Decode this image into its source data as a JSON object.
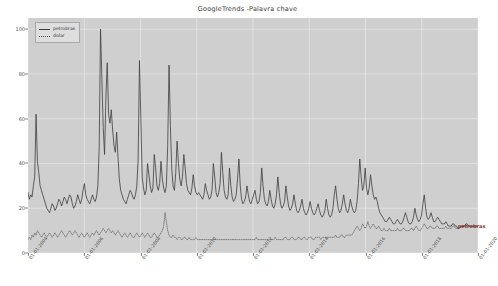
{
  "chart_data": {
    "type": "line",
    "title": "GoogleTrends -Palavra chave",
    "xlabel": "",
    "ylabel": "",
    "ylim": [
      0,
      105
    ],
    "yticks": [
      0,
      20,
      40,
      60,
      80,
      100
    ],
    "grid": true,
    "grid_color": "#e8e8e8",
    "plot_bgcolor": "#cfcfcf",
    "figure_bgcolor": "#ffffff",
    "legend_position": "upper left",
    "xticks": [
      "01-01-2004",
      "01-01-2006",
      "01-01-2008",
      "01-01-2010",
      "01-01-2012",
      "01-01-2014",
      "01-01-2016",
      "01-01-2018",
      "01-01-2020"
    ],
    "annotations": [
      {
        "text": "petrobras",
        "color": "#8b3a2e",
        "x_frac": 0.955,
        "y_value": 12
      }
    ],
    "series": [
      {
        "name": "petrobras",
        "color": "#3d3d3d",
        "linewidth": 0.8,
        "linestyle": "solid",
        "values": [
          27,
          24,
          26,
          25,
          30,
          34,
          62,
          41,
          36,
          30,
          28,
          26,
          24,
          22,
          20,
          19,
          18,
          20,
          22,
          21,
          19,
          20,
          22,
          24,
          23,
          21,
          23,
          25,
          24,
          22,
          24,
          26,
          25,
          22,
          20,
          21,
          23,
          26,
          24,
          22,
          24,
          28,
          31,
          26,
          24,
          23,
          22,
          24,
          26,
          24,
          23,
          25,
          30,
          47,
          100,
          78,
          56,
          44,
          70,
          85,
          62,
          58,
          64,
          55,
          48,
          45,
          54,
          43,
          33,
          28,
          26,
          24,
          23,
          22,
          24,
          26,
          28,
          27,
          25,
          24,
          26,
          30,
          42,
          86,
          60,
          34,
          29,
          26,
          28,
          40,
          35,
          30,
          27,
          29,
          44,
          38,
          30,
          28,
          31,
          41,
          33,
          29,
          27,
          30,
          48,
          84,
          57,
          38,
          30,
          28,
          36,
          50,
          40,
          33,
          30,
          34,
          44,
          38,
          31,
          28,
          27,
          26,
          29,
          35,
          30,
          27,
          26,
          27,
          26,
          25,
          24,
          26,
          31,
          28,
          26,
          24,
          25,
          28,
          40,
          34,
          27,
          25,
          27,
          31,
          45,
          36,
          28,
          25,
          24,
          26,
          38,
          30,
          25,
          23,
          24,
          26,
          33,
          42,
          30,
          24,
          22,
          23,
          25,
          30,
          26,
          23,
          22,
          24,
          26,
          28,
          24,
          22,
          23,
          27,
          38,
          30,
          24,
          22,
          21,
          23,
          28,
          24,
          21,
          20,
          22,
          26,
          34,
          27,
          22,
          20,
          21,
          23,
          30,
          25,
          21,
          19,
          20,
          22,
          26,
          22,
          19,
          18,
          19,
          21,
          24,
          20,
          18,
          17,
          18,
          20,
          23,
          20,
          18,
          17,
          18,
          20,
          22,
          19,
          17,
          16,
          17,
          19,
          24,
          20,
          17,
          16,
          17,
          20,
          26,
          30,
          24,
          20,
          18,
          19,
          22,
          26,
          22,
          19,
          18,
          20,
          24,
          21,
          19,
          18,
          19,
          23,
          31,
          42,
          34,
          28,
          30,
          38,
          29,
          26,
          29,
          35,
          30,
          26,
          24,
          25,
          23,
          20,
          18,
          17,
          16,
          15,
          14,
          14,
          15,
          16,
          15,
          14,
          13,
          13,
          14,
          15,
          14,
          13,
          13,
          14,
          16,
          18,
          16,
          14,
          13,
          13,
          14,
          16,
          20,
          17,
          15,
          14,
          15,
          17,
          22,
          26,
          20,
          16,
          15,
          16,
          18,
          16,
          14,
          14,
          15,
          16,
          15,
          14,
          13,
          13,
          13,
          14,
          13,
          12,
          12,
          12,
          13,
          13,
          12,
          12,
          11,
          11,
          12,
          12,
          12,
          12,
          13,
          13,
          12,
          12,
          12,
          12,
          12,
          12,
          12,
          12
        ]
      },
      {
        "name": "dolar",
        "color": "#4a4a4a",
        "linewidth": 0.6,
        "linestyle": "dotted",
        "values": [
          6,
          7,
          6,
          8,
          7,
          9,
          8,
          10,
          9,
          8,
          7,
          8,
          9,
          8,
          7,
          8,
          9,
          8,
          7,
          8,
          9,
          8,
          7,
          8,
          9,
          10,
          9,
          8,
          7,
          8,
          9,
          10,
          9,
          8,
          9,
          10,
          9,
          8,
          7,
          8,
          9,
          8,
          7,
          8,
          9,
          8,
          7,
          8,
          9,
          8,
          9,
          10,
          9,
          8,
          9,
          10,
          11,
          10,
          9,
          10,
          11,
          10,
          9,
          10,
          9,
          8,
          9,
          10,
          9,
          8,
          7,
          8,
          9,
          8,
          7,
          8,
          9,
          8,
          7,
          7,
          8,
          9,
          8,
          7,
          8,
          9,
          8,
          7,
          8,
          9,
          8,
          7,
          7,
          8,
          9,
          8,
          7,
          7,
          8,
          9,
          10,
          12,
          18,
          14,
          10,
          8,
          7,
          7,
          8,
          7,
          7,
          6,
          7,
          7,
          6,
          6,
          7,
          7,
          6,
          6,
          7,
          6,
          6,
          6,
          6,
          7,
          6,
          6,
          6,
          6,
          6,
          6,
          6,
          6,
          6,
          6,
          6,
          6,
          6,
          6,
          6,
          6,
          6,
          6,
          6,
          6,
          6,
          6,
          6,
          6,
          6,
          6,
          6,
          6,
          6,
          6,
          6,
          6,
          6,
          6,
          6,
          6,
          6,
          6,
          6,
          6,
          6,
          6,
          6,
          6,
          7,
          6,
          6,
          6,
          6,
          6,
          6,
          6,
          6,
          6,
          6,
          6,
          6,
          6,
          7,
          6,
          6,
          6,
          6,
          6,
          6,
          7,
          7,
          6,
          6,
          6,
          7,
          7,
          6,
          6,
          6,
          7,
          7,
          6,
          6,
          7,
          7,
          6,
          6,
          7,
          7,
          7,
          6,
          6,
          7,
          7,
          7,
          7,
          6,
          7,
          7,
          7,
          7,
          7,
          7,
          7,
          7,
          7,
          7,
          8,
          7,
          7,
          7,
          8,
          8,
          7,
          7,
          8,
          8,
          8,
          8,
          8,
          9,
          10,
          11,
          12,
          11,
          10,
          11,
          13,
          12,
          11,
          12,
          14,
          12,
          11,
          12,
          13,
          12,
          11,
          11,
          12,
          11,
          10,
          10,
          11,
          10,
          10,
          10,
          11,
          10,
          10,
          10,
          10,
          10,
          11,
          10,
          10,
          10,
          11,
          11,
          10,
          10,
          10,
          10,
          11,
          11,
          10,
          11,
          12,
          11,
          10,
          10,
          11,
          12,
          13,
          12,
          11,
          11,
          12,
          12,
          11,
          11,
          11,
          12,
          12,
          11,
          11,
          11,
          11,
          11,
          12,
          11,
          11,
          11,
          11,
          12,
          12,
          11,
          11,
          11,
          11,
          12,
          12,
          12,
          12,
          12,
          12,
          12,
          12,
          12,
          12,
          12,
          12,
          12,
          12
        ]
      }
    ]
  }
}
